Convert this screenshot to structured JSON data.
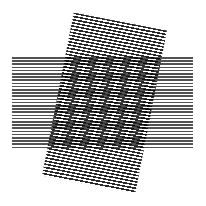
{
  "image": {
    "description": "Moire pattern: a horizontal band of fine horizontal lines overlapped by a slightly rotated rectangle of fine lines",
    "background": "#ffffff",
    "line_color": "#2a2a2a",
    "horizontal_band": {
      "x": 12,
      "y": 57,
      "width": 181,
      "height": 91
    },
    "rotated_rect": {
      "corners": [
        [
          70,
          13
        ],
        [
          163,
          33
        ],
        [
          135,
          196
        ],
        [
          42,
          182
        ]
      ],
      "rotation_deg": 11
    }
  }
}
